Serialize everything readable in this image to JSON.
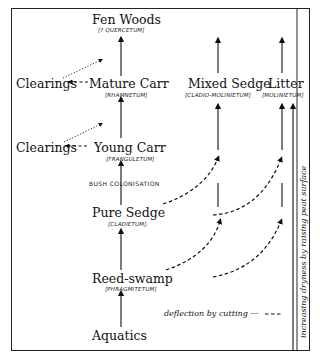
{
  "diagram": {
    "nodes": {
      "fen_woods": {
        "label": "Fen Woods",
        "sub": "[? QUERCETUM]"
      },
      "mature_carr": {
        "label": "Mature Carr",
        "sub": "[RHAMNETUM]"
      },
      "young_carr": {
        "label": "Young Carr",
        "sub": "[FRANGULETUM]"
      },
      "pure_sedge": {
        "label": "Pure Sedge",
        "sub": "[CLADIETUM]."
      },
      "reed_swamp": {
        "label": "Reed-swamp",
        "sub": "[PHRAGMITETUM]"
      },
      "aquatics": {
        "label": "Aquatics"
      },
      "mixed_sedge": {
        "label": "Mixed Sedge",
        "sub": "[CLADIO-MOLINIETUM]"
      },
      "litter": {
        "label": "Litter",
        "sub": "[MOLINIETUM]"
      },
      "clearings_upper": {
        "label": "Clearings"
      },
      "clearings_lower": {
        "label": "Clearings"
      }
    },
    "annotations": {
      "bush_colonisation": "BUSH COLONISATION",
      "legend": "deflection by cutting ---",
      "side_axis": "increasing dryness  by  raising peat surface"
    },
    "edges": [
      {
        "from": "Aquatics",
        "to": "Reed-swamp",
        "style": "solid"
      },
      {
        "from": "Reed-swamp",
        "to": "Pure Sedge",
        "style": "solid"
      },
      {
        "from": "Pure Sedge",
        "to": "Young Carr",
        "style": "solid",
        "label": "BUSH COLONISATION"
      },
      {
        "from": "Young Carr",
        "to": "Mature Carr",
        "style": "solid"
      },
      {
        "from": "Mature Carr",
        "to": "Fen Woods",
        "style": "solid"
      },
      {
        "from": "Young Carr",
        "to": "Clearings",
        "style": "dashed"
      },
      {
        "from": "Clearings",
        "to": "Mature Carr path",
        "style": "dotted"
      },
      {
        "from": "Mature Carr",
        "to": "Clearings",
        "style": "dashed"
      },
      {
        "from": "Clearings",
        "to": "Fen Woods path",
        "style": "dotted"
      },
      {
        "from": "Reed-swamp",
        "to": "Mixed Sedge column",
        "style": "dashed",
        "meaning": "deflection by cutting"
      },
      {
        "from": "Pure Sedge",
        "to": "Mixed Sedge column",
        "style": "dashed",
        "meaning": "deflection by cutting"
      },
      {
        "from": "Mixed Sedge column",
        "to": "Litter column",
        "style": "dashed",
        "meaning": "deflection by cutting"
      },
      {
        "from": "Mixed Sedge",
        "to": "top",
        "style": "solid"
      },
      {
        "from": "Litter",
        "to": "top",
        "style": "solid"
      }
    ]
  }
}
